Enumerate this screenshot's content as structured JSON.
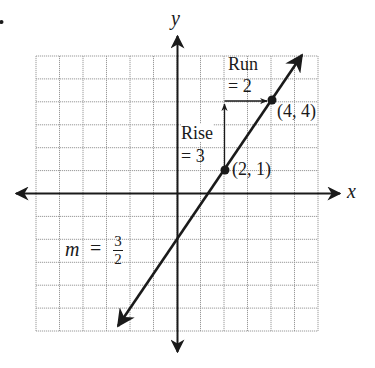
{
  "figure": {
    "corner_mark": "."
  },
  "axes": {
    "x_label": "x",
    "y_label": "y",
    "grid": {
      "cols": 12,
      "rows": 12,
      "x_range": [
        -6,
        6
      ],
      "y_range": [
        -6,
        6
      ]
    }
  },
  "line": {
    "slope_label": {
      "m": "m",
      "equals": "=",
      "numerator": "3",
      "denominator": "2"
    },
    "points": [
      {
        "label": "(2, 1)",
        "x": 2,
        "y": 1
      },
      {
        "label": "(4, 4)",
        "x": 4,
        "y": 4
      }
    ]
  },
  "annotations": {
    "rise": {
      "line1": "Rise",
      "line2": "= 3"
    },
    "run": {
      "line1": "Run",
      "line2": "= 2"
    }
  },
  "colors": {
    "ink": "#1a1a1a",
    "grid": "#9a9a9a",
    "background": "#ffffff"
  }
}
